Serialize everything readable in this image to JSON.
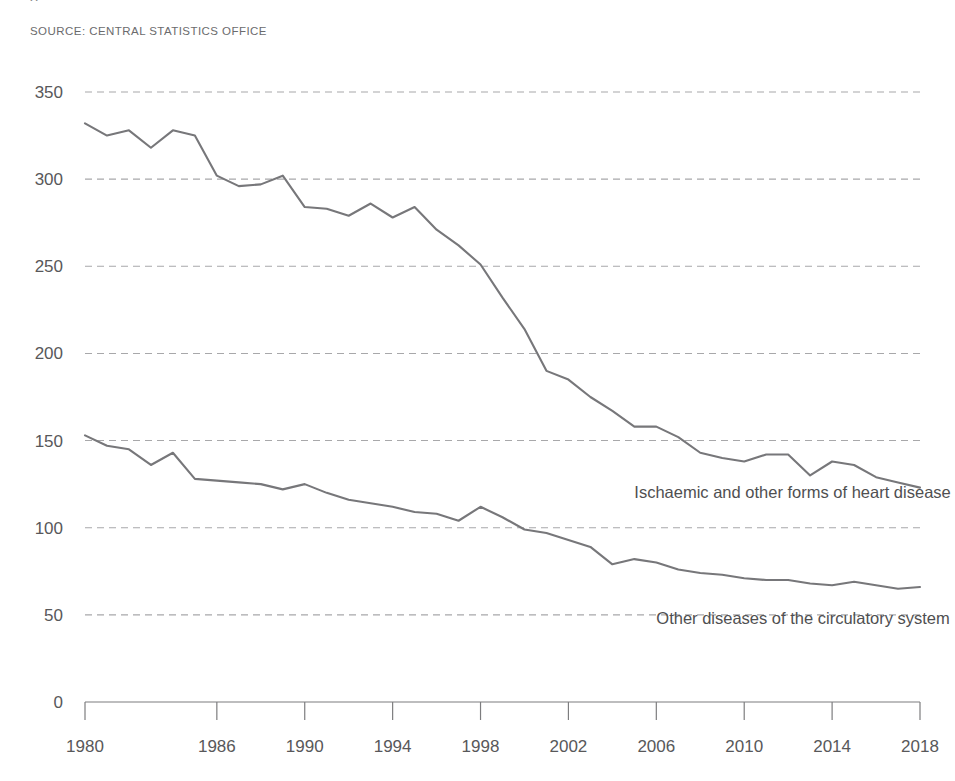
{
  "source_note": "SOURCE: CENTRAL STATISTICS OFFICE",
  "title_fragment": "g",
  "colors": {
    "line": "#77777a",
    "gridline": "#a8a8aa",
    "axis": "#7d7d7f",
    "text": "#58585a",
    "background": "#ffffff"
  },
  "labels": {
    "series_heart": "Ischaemic and other forms of heart disease",
    "series_circulatory": "Other diseases of the circulatory system"
  },
  "chart_data": {
    "type": "line",
    "title": "",
    "subtitle": "",
    "xlabel": "",
    "ylabel": "",
    "xlim": [
      1980,
      2018
    ],
    "ylim": [
      0,
      350
    ],
    "grid": true,
    "grid_axis": "y",
    "legend_position": "inline-right",
    "ytick_labels": [
      "0",
      "50",
      "100",
      "150",
      "200",
      "250",
      "300",
      "350"
    ],
    "yticks": [
      0,
      50,
      100,
      150,
      200,
      250,
      300,
      350
    ],
    "xtick_labels": [
      "1980",
      "1986",
      "1990",
      "1994",
      "1998",
      "2002",
      "2006",
      "2010",
      "2014",
      "2018"
    ],
    "xticks": [
      1980,
      1986,
      1990,
      1994,
      1998,
      2002,
      2006,
      2010,
      2014,
      2018
    ],
    "x": [
      1980,
      1981,
      1982,
      1983,
      1984,
      1985,
      1986,
      1987,
      1988,
      1989,
      1990,
      1991,
      1992,
      1993,
      1994,
      1995,
      1996,
      1997,
      1998,
      1999,
      2000,
      2001,
      2002,
      2003,
      2004,
      2005,
      2006,
      2007,
      2008,
      2009,
      2010,
      2011,
      2012,
      2013,
      2014,
      2015,
      2016,
      2017,
      2018
    ],
    "series": [
      {
        "name": "Ischaemic and other forms of heart disease",
        "values": [
          332,
          325,
          328,
          318,
          328,
          325,
          302,
          296,
          297,
          302,
          284,
          283,
          279,
          286,
          278,
          284,
          271,
          262,
          251,
          232,
          214,
          190,
          185,
          175,
          167,
          158,
          158,
          152,
          143,
          140,
          138,
          142,
          142,
          130,
          138,
          136,
          129,
          126,
          123
        ]
      },
      {
        "name": "Other diseases of the circulatory system",
        "values": [
          153,
          147,
          145,
          136,
          143,
          128,
          127,
          126,
          125,
          122,
          125,
          120,
          116,
          114,
          112,
          109,
          108,
          104,
          112,
          106,
          99,
          97,
          93,
          89,
          79,
          82,
          80,
          76,
          74,
          73,
          71,
          70,
          70,
          68,
          67,
          69,
          67,
          65,
          66
        ]
      }
    ],
    "annotations": [
      {
        "text": "Ischaemic and other forms of heart disease",
        "x": 2005,
        "y": 117
      },
      {
        "text": "Other diseases of the circulatory system",
        "x": 2006,
        "y": 45
      }
    ]
  }
}
